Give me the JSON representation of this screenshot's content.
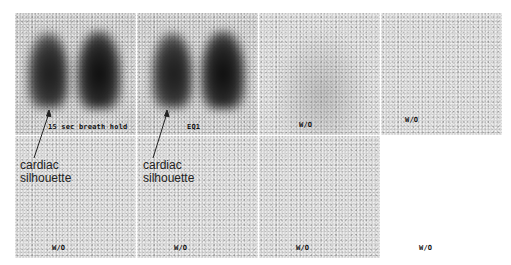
{
  "figure": {
    "type": "nuclear medicine lung ventilation scan series",
    "layout": {
      "rows": 2,
      "columns": 4
    },
    "panels": [
      {
        "row": 1,
        "col": 1,
        "label": "15 sec breath hold",
        "content": "lungs-bright"
      },
      {
        "row": 1,
        "col": 2,
        "label": "EQ1",
        "content": "lungs-bright"
      },
      {
        "row": 1,
        "col": 3,
        "label": "W/O",
        "content": "faint"
      },
      {
        "row": 1,
        "col": 4,
        "label": "W/O",
        "content": "faint"
      },
      {
        "row": 2,
        "col": 1,
        "label": "W/O",
        "content": "faint"
      },
      {
        "row": 2,
        "col": 2,
        "label": "W/O",
        "content": "faint"
      },
      {
        "row": 2,
        "col": 3,
        "label": "W/O",
        "content": "faint"
      },
      {
        "row": 2,
        "col": 4,
        "label": "W/O",
        "content": "blank"
      }
    ],
    "annotations": [
      {
        "text_line1": "cardiac",
        "text_line2": "silhouette",
        "points_to_panel": 1
      },
      {
        "text_line1": "cardiac",
        "text_line2": "silhouette",
        "points_to_panel": 2
      }
    ]
  }
}
